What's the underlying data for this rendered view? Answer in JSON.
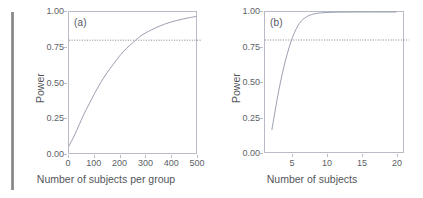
{
  "figure": {
    "background_color": "#ffffff",
    "artifact": {
      "name": "scan-edge-artifact",
      "color": "#6e6e6e"
    }
  },
  "chart_data": [
    {
      "type": "line",
      "panel_label": "(a)",
      "title": "",
      "xlabel": "Number of subjects per group",
      "ylabel": "Power",
      "xlim": [
        0,
        500
      ],
      "ylim": [
        0.0,
        1.0
      ],
      "xticks": [
        0,
        100,
        200,
        300,
        400,
        500
      ],
      "xticklabels": [
        "0",
        "100",
        "200",
        "300",
        "400",
        "500"
      ],
      "yticks": [
        0.0,
        0.25,
        0.5,
        0.75,
        1.0
      ],
      "yticklabels": [
        "0.00",
        "0.25",
        "0.50",
        "0.75",
        "1.00"
      ],
      "grid": false,
      "legend": "none",
      "line_color": "#8e93a8",
      "reference_line": {
        "name": "power-threshold",
        "orientation": "horizontal",
        "value": 0.8,
        "style": "dotted",
        "color": "#7a7d88"
      },
      "x": [
        0,
        20,
        40,
        60,
        80,
        100,
        125,
        150,
        175,
        200,
        225,
        250,
        275,
        300,
        325,
        350,
        375,
        400,
        425,
        450,
        475,
        500
      ],
      "y": [
        0.05,
        0.12,
        0.2,
        0.28,
        0.35,
        0.42,
        0.5,
        0.57,
        0.63,
        0.69,
        0.74,
        0.78,
        0.82,
        0.85,
        0.874,
        0.895,
        0.913,
        0.928,
        0.94,
        0.951,
        0.96,
        0.968
      ]
    },
    {
      "type": "line",
      "panel_label": "(b)",
      "title": "",
      "xlabel": "Number of subjects",
      "ylabel": "Power",
      "xlim": [
        1,
        21
      ],
      "ylim": [
        0.0,
        1.0
      ],
      "xticks": [
        5,
        10,
        15,
        20
      ],
      "xticklabels": [
        "5",
        "10",
        "15",
        "20"
      ],
      "yticks": [
        0.0,
        0.25,
        0.5,
        0.75,
        1.0
      ],
      "yticklabels": [
        "0.00",
        "0.25",
        "0.50",
        "0.75",
        "1.00"
      ],
      "grid": false,
      "legend": "none",
      "line_color": "#8e93a8",
      "reference_line": {
        "name": "power-threshold",
        "orientation": "horizontal",
        "value": 0.8,
        "style": "dotted",
        "color": "#7a7d88"
      },
      "x": [
        2,
        3,
        4,
        5,
        6,
        7,
        8,
        9,
        10,
        11,
        12,
        13,
        14,
        15,
        16,
        17,
        18,
        19,
        20
      ],
      "y": [
        0.16,
        0.44,
        0.66,
        0.82,
        0.92,
        0.965,
        0.985,
        0.993,
        0.997,
        0.998,
        0.999,
        0.999,
        1.0,
        1.0,
        1.0,
        1.0,
        1.0,
        1.0,
        1.0
      ]
    }
  ]
}
